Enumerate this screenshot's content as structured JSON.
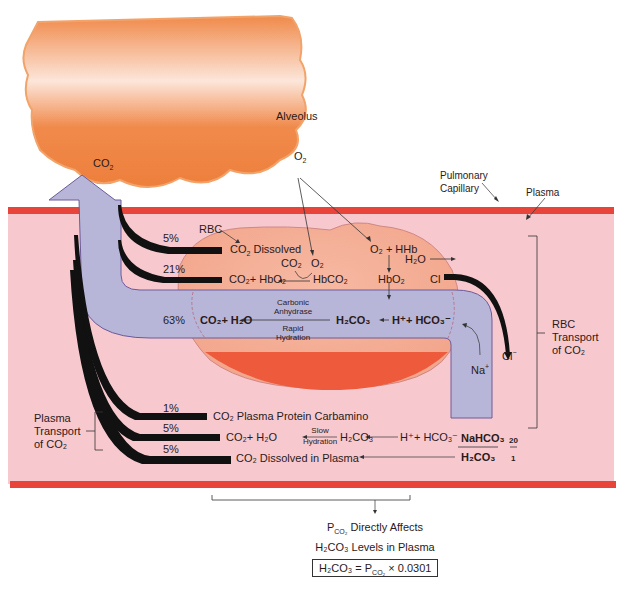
{
  "alveolus": {
    "label": "Alveolus",
    "co2": "CO",
    "co2_sub": "2",
    "o2": "O",
    "o2_sub": "2"
  },
  "capillary": {
    "pulmonary_label_1": "Pulmonary",
    "pulmonary_label_2": "Capillary",
    "plasma_label": "Plasma"
  },
  "rbc": {
    "label": "RBC",
    "dissolved": {
      "percent": "5%",
      "text_pre": "CO",
      "sub": "2",
      "text_post": " Dissolved"
    },
    "hbo2_path": {
      "percent": "21%",
      "left": "CO₂+ HbO₂",
      "right": "HbCO₂",
      "co2": "CO₂",
      "o2": "O₂"
    },
    "o2_hhb": "O₂ + HHb",
    "hbo2": "HbO₂",
    "h2o": "H₂O",
    "cl": "Cl",
    "cl_out": "Cl",
    "na": "Na",
    "main": {
      "percent": "63%",
      "left": "CO₂+ H₂O",
      "enzyme_1": "Carbonic",
      "enzyme_2": "Anhydrase",
      "rate_1": "Rapid",
      "rate_2": "Hydration",
      "mid": "H₂CO₃",
      "right": "H⁺+ HCO₃⁻"
    },
    "transport_label_1": "RBC",
    "transport_label_2": "Transport",
    "transport_label_3": "of CO₂"
  },
  "plasma": {
    "transport_label_1": "Plasma",
    "transport_label_2": "Transport",
    "transport_label_3": "of  CO₂",
    "rows": [
      {
        "percent": "1%",
        "text": "CO₂  Plasma Protein Carbamino"
      },
      {
        "percent": "5%",
        "text": "CO₂+ H₂O",
        "rate_1": "Slow",
        "rate_2": "Hydration",
        "mid": "H₂CO₃",
        "right": "H⁺+ HCO₃⁻"
      },
      {
        "percent": "5%",
        "text": "CO₂  Dissolved in Plasma"
      }
    ],
    "ratio": {
      "numerator": "NaHCO₃",
      "denominator": "H₂CO₃",
      "num_value": "20",
      "den_value": "1"
    }
  },
  "footer": {
    "line1": "P",
    "line1_sub": "CO₂",
    "line1_post": " Directly Affects",
    "line2": "H₂CO₃  Levels in Plasma",
    "formula_pre": "H₂CO₃ = P",
    "formula_sub": "CO₂",
    "formula_post": " × 0.0301"
  },
  "colors": {
    "alveolus": "#f08a4b",
    "capillary_wall": "#e8443a",
    "plasma": "#f7c9cf",
    "rbc": "#f5a98f",
    "arrow": "#b8b6d8",
    "rbc_bottom": "#ee5a3c"
  }
}
